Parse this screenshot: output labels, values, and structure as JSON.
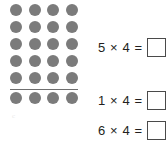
{
  "worksheet": {
    "title": "Multiplication array worksheet",
    "background_color": "#ffffff",
    "dot_color": "#7b7b7b",
    "text_color": "#231f20",
    "box_border_color": "#4a4a4a"
  },
  "array": {
    "name": "dot-array",
    "rows": 6,
    "columns": 4,
    "total_dots": 24,
    "divider_after_row": 5,
    "divider_visible": true,
    "faint_mark": "c"
  },
  "equations": [
    {
      "left_factor": "5",
      "operator": "×",
      "right_factor": "4",
      "equals": "=",
      "text": "5 × 4 =",
      "answer": "",
      "answer_placeholder": ""
    },
    {
      "left_factor": "1",
      "operator": "×",
      "right_factor": "4",
      "equals": "=",
      "text": "1 × 4 =",
      "answer": "",
      "answer_placeholder": ""
    },
    {
      "left_factor": "6",
      "operator": "×",
      "right_factor": "4",
      "equals": "=",
      "text": "6 × 4 =",
      "answer": "",
      "answer_placeholder": ""
    }
  ]
}
